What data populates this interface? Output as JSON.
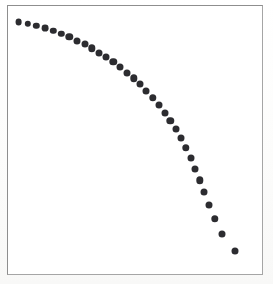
{
  "figure": {
    "type": "scatter-plot",
    "background_color": "#fdfdfc",
    "frame_color": "#9a9a9a",
    "title": "",
    "subtitle": ""
  },
  "chart_data": {
    "type": "scatter",
    "title": "",
    "subtitle": "",
    "xlabel": "",
    "ylabel": "",
    "xlim": [
      0,
      100
    ],
    "ylim": [
      0,
      100
    ],
    "grid": false,
    "legend": null,
    "axis_ticks": [],
    "tick_labels": [],
    "annotations": [],
    "marker": {
      "shape": "circle",
      "color": "#2c2c30",
      "size_px": 7,
      "filled": true
    },
    "n_points": 33,
    "series": [
      {
        "name": "series-1",
        "x": [
          4.5,
          8.0,
          11.4,
          14.8,
          18.0,
          21.2,
          24.3,
          27.3,
          30.3,
          33.2,
          36.1,
          38.9,
          41.7,
          44.4,
          47.1,
          49.8,
          52.4,
          55.0,
          57.6,
          60.1,
          62.6,
          65.1,
          67.5,
          69.9,
          72.2,
          74.5,
          76.7,
          78.9,
          81.0,
          83.0,
          85.0,
          86.8,
          88.5
        ],
        "y": [
          93.8,
          93.1,
          92.3,
          91.4,
          90.4,
          89.3,
          88.1,
          86.8,
          85.4,
          83.9,
          82.3,
          80.6,
          78.8,
          76.9,
          74.9,
          72.7,
          70.4,
          68.0,
          65.4,
          62.7,
          59.8,
          56.8,
          53.6,
          50.2,
          46.6,
          42.8,
          38.8,
          34.5,
          30.0,
          25.2,
          20.1,
          14.6,
          8.7
        ]
      }
    ]
  },
  "points_px": [
    {
      "x": 18.5,
      "y": 22.0
    },
    {
      "x": 27.5,
      "y": 23.8
    },
    {
      "x": 36.2,
      "y": 25.9
    },
    {
      "x": 45.0,
      "y": 28.2
    },
    {
      "x": 53.2,
      "y": 30.9
    },
    {
      "x": 61.4,
      "y": 33.8
    },
    {
      "x": 69.3,
      "y": 37.0
    },
    {
      "x": 77.0,
      "y": 40.5
    },
    {
      "x": 84.6,
      "y": 44.3
    },
    {
      "x": 92.0,
      "y": 48.3
    },
    {
      "x": 99.3,
      "y": 52.6
    },
    {
      "x": 106.4,
      "y": 57.2
    },
    {
      "x": 113.4,
      "y": 62.0
    },
    {
      "x": 120.2,
      "y": 67.1
    },
    {
      "x": 126.9,
      "y": 72.5
    },
    {
      "x": 133.5,
      "y": 78.2
    },
    {
      "x": 140.0,
      "y": 84.3
    },
    {
      "x": 146.3,
      "y": 90.8
    },
    {
      "x": 152.5,
      "y": 97.7
    },
    {
      "x": 158.6,
      "y": 105.0
    },
    {
      "x": 164.5,
      "y": 112.7
    },
    {
      "x": 170.2,
      "y": 120.8
    },
    {
      "x": 175.7,
      "y": 129.3
    },
    {
      "x": 181.0,
      "y": 138.4
    },
    {
      "x": 186.1,
      "y": 148.0
    },
    {
      "x": 190.9,
      "y": 158.2
    },
    {
      "x": 195.4,
      "y": 168.9
    },
    {
      "x": 199.7,
      "y": 180.2
    },
    {
      "x": 204.2,
      "y": 192.4
    },
    {
      "x": 209.0,
      "y": 205.3
    },
    {
      "x": 214.7,
      "y": 219.0
    },
    {
      "x": 222.0,
      "y": 233.9
    },
    {
      "x": 234.5,
      "y": 250.5
    }
  ]
}
